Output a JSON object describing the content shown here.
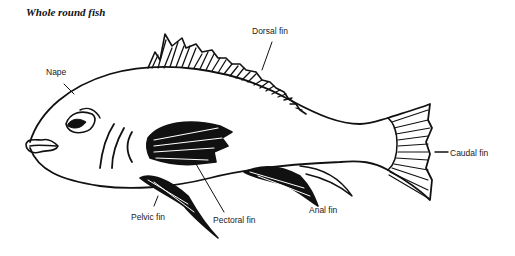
{
  "title": "Whole round fish",
  "labels": {
    "dorsal_fin": "Dorsal fin",
    "nape": "Nape",
    "caudal_fin": "Caudal fin",
    "pectoral_fin": "Pectoral fin",
    "pelvic_fin": "Pelvic fin",
    "anal_fin": "Anal fin"
  },
  "colors": {
    "ink": "#111111",
    "background": "#ffffff"
  }
}
